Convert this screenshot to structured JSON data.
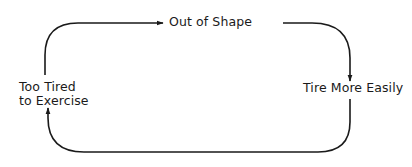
{
  "diagram": {
    "type": "cycle",
    "nodes": [
      {
        "id": "out_of_shape",
        "label": "Out of Shape"
      },
      {
        "id": "tire_more_easily",
        "label": "Tire More Easily"
      },
      {
        "id": "too_tired",
        "label_line1": "Too Tired",
        "label_line2": "to Exercise"
      }
    ],
    "edges": [
      {
        "from": "too_tired",
        "to": "out_of_shape"
      },
      {
        "from": "out_of_shape",
        "to": "tire_more_easily"
      },
      {
        "from": "tire_more_easily",
        "to": "too_tired"
      }
    ],
    "colors": {
      "line": "#1a1a1a",
      "background": "#ffffff"
    }
  }
}
